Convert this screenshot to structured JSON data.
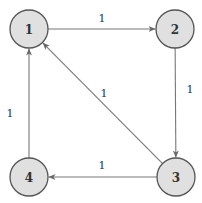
{
  "diagram": {
    "type": "directed-graph",
    "colors": {
      "node_fill": "#e0e0e0",
      "node_stroke": "#555555",
      "edge": "#777777",
      "text": "#333333"
    },
    "nodes": [
      {
        "id": "1",
        "label": "1",
        "cx": 29,
        "cy": 29,
        "r": 19
      },
      {
        "id": "2",
        "label": "2",
        "cx": 175,
        "cy": 29,
        "r": 19
      },
      {
        "id": "3",
        "label": "3",
        "cx": 176,
        "cy": 177,
        "r": 19
      },
      {
        "id": "4",
        "label": "4",
        "cx": 29,
        "cy": 177,
        "r": 19
      }
    ],
    "edges": [
      {
        "from": "1",
        "to": "2",
        "weight": "1",
        "label_x": 102,
        "label_y": 18
      },
      {
        "from": "2",
        "to": "3",
        "weight": "1",
        "label_x": 190,
        "label_y": 89
      },
      {
        "from": "3",
        "to": "1",
        "weight": "1",
        "label_x": 104,
        "label_y": 93
      },
      {
        "from": "3",
        "to": "4",
        "weight": "1",
        "label_x": 102,
        "label_y": 165
      },
      {
        "from": "4",
        "to": "1",
        "weight": "1",
        "label_x": 10,
        "label_y": 113
      }
    ]
  }
}
